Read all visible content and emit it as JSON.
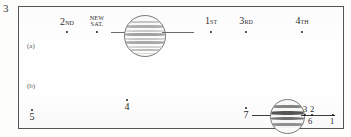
{
  "figure": {
    "number": "3",
    "panels": [
      {
        "id": "a",
        "label": "(a)"
      },
      {
        "id": "b",
        "label": "(b)"
      }
    ]
  },
  "panel_a": {
    "satellites": [
      {
        "name": "second-satellite",
        "label_main": "2",
        "label_suffix": "ND",
        "label_full": "2ND"
      },
      {
        "name": "new-satellite",
        "label_line1": "NEW",
        "label_line2": "SAT.",
        "label_full": "NEW SAT."
      },
      {
        "name": "first-satellite",
        "label_main": "1",
        "label_suffix": "ST",
        "label_full": "1ST"
      },
      {
        "name": "third-satellite",
        "label_main": "3",
        "label_suffix": "RD",
        "label_full": "3RD"
      },
      {
        "name": "fourth-satellite",
        "label_main": "4",
        "label_suffix": "TH",
        "label_full": "4TH"
      }
    ],
    "planet": {
      "name": "jupiter-disk-a",
      "bands": 9
    }
  },
  "panel_b": {
    "marks": [
      {
        "name": "mark-5",
        "num": "5"
      },
      {
        "name": "mark-4",
        "num": "4"
      },
      {
        "name": "mark-7",
        "num": "7"
      }
    ],
    "planet": {
      "name": "jupiter-disk-b",
      "bands": 4
    },
    "tick_labels_above": [
      "3",
      "2"
    ],
    "tick_labels_below": [
      "6",
      "1"
    ]
  },
  "colors": {
    "ink": "#2b2b2b",
    "frame": "#555555",
    "paper": "#fefefe",
    "band": "#8a8a8a"
  }
}
